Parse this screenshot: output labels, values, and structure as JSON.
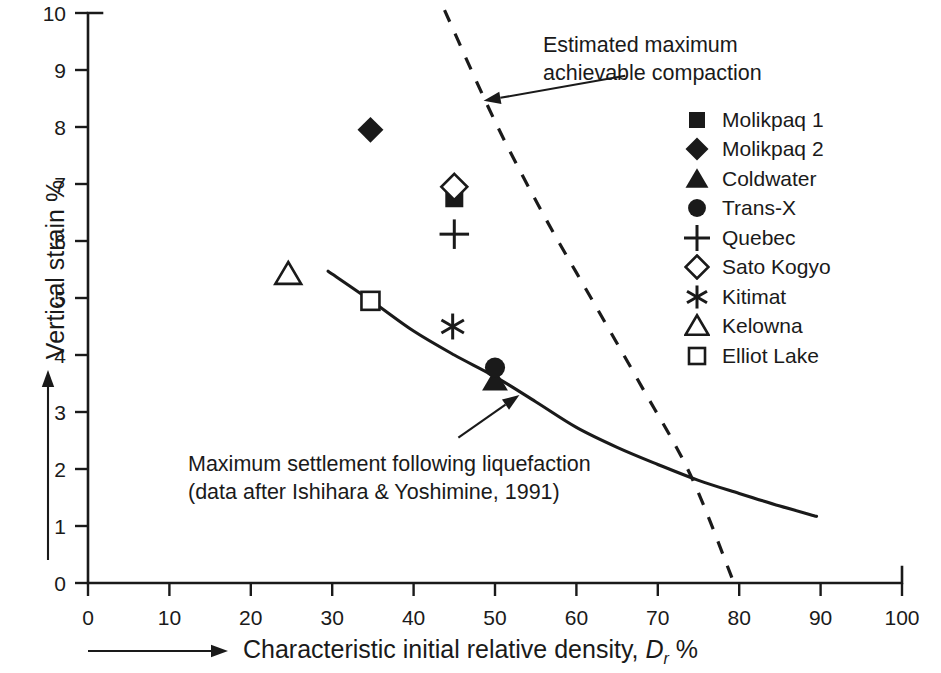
{
  "chart_data": {
    "type": "scatter",
    "title": "",
    "xlabel": "Characteristic initial relative density, Dr %",
    "ylabel": "Vertical strain %",
    "xlim": [
      0,
      100
    ],
    "ylim": [
      0,
      10
    ],
    "xticks": [
      0,
      10,
      20,
      30,
      40,
      50,
      60,
      70,
      80,
      90,
      100
    ],
    "yticks": [
      0,
      1,
      2,
      3,
      4,
      5,
      6,
      7,
      8,
      9,
      10
    ],
    "grid": false,
    "legend_position": "right",
    "series": [
      {
        "name": "Molikpaq 1",
        "marker": "filled-square",
        "points": [
          [
            45.0,
            6.75
          ]
        ]
      },
      {
        "name": "Molikpaq 2",
        "marker": "filled-diamond",
        "points": [
          [
            34.7,
            7.95
          ]
        ]
      },
      {
        "name": "Coldwater",
        "marker": "filled-triangle",
        "points": [
          [
            50.0,
            3.55
          ]
        ]
      },
      {
        "name": "Trans-X",
        "marker": "filled-circle",
        "points": [
          [
            50.0,
            3.78
          ]
        ]
      },
      {
        "name": "Quebec",
        "marker": "plus",
        "points": [
          [
            45.0,
            6.12
          ]
        ]
      },
      {
        "name": "Sato Kogyo",
        "marker": "open-diamond",
        "points": [
          [
            45.0,
            6.95
          ]
        ]
      },
      {
        "name": "Kitimat",
        "marker": "asterisk",
        "points": [
          [
            44.8,
            4.5
          ]
        ]
      },
      {
        "name": "Kelowna",
        "marker": "open-triangle",
        "points": [
          [
            24.6,
            5.42
          ]
        ]
      },
      {
        "name": "Elliot Lake",
        "marker": "open-square",
        "points": [
          [
            34.7,
            4.95
          ]
        ]
      }
    ],
    "curves": [
      {
        "name": "Maximum settlement following liquefaction",
        "style": "solid",
        "points": [
          [
            29.5,
            5.47
          ],
          [
            35.0,
            4.93
          ],
          [
            40.0,
            4.42
          ],
          [
            45.0,
            4.0
          ],
          [
            50.0,
            3.62
          ],
          [
            55.0,
            3.18
          ],
          [
            60.0,
            2.73
          ],
          [
            65.0,
            2.38
          ],
          [
            70.0,
            2.08
          ],
          [
            75.0,
            1.8
          ],
          [
            80.0,
            1.57
          ],
          [
            85.0,
            1.35
          ],
          [
            89.5,
            1.17
          ]
        ]
      },
      {
        "name": "Estimated maximum achievable compaction",
        "style": "dashed",
        "points": [
          [
            43.8,
            10.05
          ],
          [
            50.0,
            8.1
          ],
          [
            56.0,
            6.45
          ],
          [
            62.0,
            4.95
          ],
          [
            68.0,
            3.45
          ],
          [
            74.0,
            1.9
          ],
          [
            79.3,
            0.02
          ]
        ]
      }
    ],
    "annotations": [
      {
        "name": "estimated-maximum-achievable-compaction",
        "lines": [
          "Estimated maximum",
          "achievable compaction"
        ],
        "arrow_from": [
          66.0,
          8.9
        ],
        "arrow_to": [
          48.6,
          8.46
        ]
      },
      {
        "name": "maximum-settlement-following-liquefaction",
        "lines": [
          "Maximum settlement following liquefaction",
          "(data after Ishihara & Yoshimine, 1991)"
        ],
        "arrow_from": [
          45.5,
          2.55
        ],
        "arrow_to": [
          53.0,
          3.3
        ]
      }
    ],
    "axis_title_arrows": {
      "x_arrow": "rightward-arrow",
      "y_arrow": "upward-arrow"
    },
    "colors": {
      "ink": "#1a1a1a",
      "background": "#ffffff"
    }
  },
  "axes": {
    "y_title": "Vertical strain %",
    "x_title_prefix": "Characteristic initial relative density, ",
    "x_title_symbol": "D",
    "x_title_subscript": "r",
    "x_title_suffix": " %",
    "x_tick_labels": [
      "0",
      "10",
      "20",
      "30",
      "40",
      "50",
      "60",
      "70",
      "80",
      "90",
      "100"
    ],
    "y_tick_labels": [
      "0",
      "1",
      "2",
      "3",
      "4",
      "5",
      "6",
      "7",
      "8",
      "9",
      "10"
    ]
  },
  "legend": {
    "items": [
      {
        "label": "Molikpaq 1",
        "marker": "filled-square"
      },
      {
        "label": "Molikpaq 2",
        "marker": "filled-diamond"
      },
      {
        "label": "Coldwater",
        "marker": "filled-triangle"
      },
      {
        "label": "Trans-X",
        "marker": "filled-circle"
      },
      {
        "label": "Quebec",
        "marker": "plus"
      },
      {
        "label": "Sato Kogyo",
        "marker": "open-diamond"
      },
      {
        "label": "Kitimat",
        "marker": "asterisk"
      },
      {
        "label": "Kelowna",
        "marker": "open-triangle"
      },
      {
        "label": "Elliot Lake",
        "marker": "open-square"
      }
    ]
  },
  "annotations": {
    "compaction_line1": "Estimated maximum",
    "compaction_line2": "achievable compaction",
    "settlement_line1": "Maximum settlement following liquefaction",
    "settlement_line2": "(data after Ishihara & Yoshimine, 1991)"
  }
}
